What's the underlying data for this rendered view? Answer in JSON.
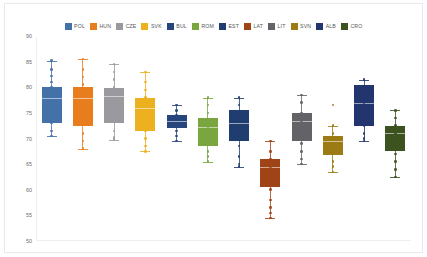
{
  "chart_data": {
    "type": "box",
    "title": "",
    "xlabel": "",
    "ylabel": "",
    "ylim": [
      50,
      90
    ],
    "ytick_labels": [
      "90",
      "85",
      "80",
      "75",
      "70",
      "65",
      "60",
      "55",
      "50"
    ],
    "ytick_values": [
      90,
      85,
      80,
      75,
      70,
      65,
      60,
      55,
      50
    ],
    "grid": false,
    "legend_position": "top-center",
    "categories": [
      "POL",
      "HUN",
      "CZE",
      "SVK",
      "BUL",
      "ROM",
      "EST",
      "LAT",
      "LIT",
      "SVN",
      "ALB",
      "CRO"
    ],
    "colors": [
      "#4472a8",
      "#e87d1e",
      "#9a9a9e",
      "#edb01f",
      "#26457c",
      "#7aa63f",
      "#1f3d6e",
      "#9e4416",
      "#636367",
      "#9c7a14",
      "#23356e",
      "#3c5320"
    ],
    "series": [
      {
        "name": "POL",
        "color": "#4472a8",
        "whisker_high": 85.2,
        "q3": 80.0,
        "median": 78.0,
        "q1": 73.0,
        "whisker_low": 70.5,
        "points": [
          85.2,
          83.5,
          82.2,
          81.0,
          80.0,
          78.6,
          77.5,
          75.0,
          73.0,
          71.5,
          70.5
        ]
      },
      {
        "name": "HUN",
        "color": "#e87d1e",
        "whisker_high": 85.5,
        "q3": 80.0,
        "median": 78.0,
        "q1": 72.5,
        "whisker_low": 68.0,
        "points": [
          85.5,
          83.5,
          82.0,
          80.5,
          78.5,
          77.0,
          75.0,
          73.0,
          71.0,
          69.5,
          68.0
        ]
      },
      {
        "name": "CZE",
        "color": "#9a9a9e",
        "whisker_high": 84.5,
        "q3": 79.8,
        "median": 78.2,
        "q1": 73.0,
        "whisker_low": 69.8,
        "points": [
          84.5,
          83.0,
          81.5,
          80.0,
          78.5,
          77.0,
          75.5,
          73.5,
          71.5,
          70.2,
          69.8
        ]
      },
      {
        "name": "SVK",
        "color": "#edb01f",
        "whisker_high": 83.0,
        "q3": 78.0,
        "median": 76.0,
        "q1": 71.5,
        "whisker_low": 67.5,
        "points": [
          83.0,
          81.0,
          79.5,
          78.0,
          76.5,
          75.0,
          73.5,
          71.5,
          70.0,
          68.5,
          67.5
        ]
      },
      {
        "name": "BUL",
        "color": "#26457c",
        "whisker_high": 76.5,
        "q3": 74.5,
        "median": 73.5,
        "q1": 72.0,
        "whisker_low": 69.5,
        "points": [
          76.5,
          75.5,
          74.5,
          73.8,
          73.0,
          72.5,
          71.5,
          70.5,
          69.5
        ]
      },
      {
        "name": "ROM",
        "color": "#7aa63f",
        "whisker_high": 78.0,
        "q3": 74.0,
        "median": 72.2,
        "q1": 68.5,
        "whisker_low": 65.5,
        "points": [
          78.0,
          76.5,
          75.0,
          73.5,
          72.0,
          70.5,
          69.0,
          67.5,
          66.5,
          65.5
        ]
      },
      {
        "name": "EST",
        "color": "#1f3d6e",
        "whisker_high": 78.0,
        "q3": 75.5,
        "median": 73.0,
        "q1": 69.5,
        "whisker_low": 64.5,
        "points": [
          78.0,
          76.5,
          75.0,
          73.5,
          72.0,
          70.0,
          68.5,
          66.5,
          65.0,
          64.5
        ]
      },
      {
        "name": "LAT",
        "color": "#9e4416",
        "whisker_high": 69.5,
        "q3": 66.0,
        "median": 64.5,
        "q1": 60.5,
        "whisker_low": 54.5,
        "points": [
          69.5,
          67.5,
          66.0,
          64.5,
          63.0,
          61.5,
          60.0,
          58.0,
          56.5,
          55.5,
          54.5
        ]
      },
      {
        "name": "LIT",
        "color": "#636367",
        "whisker_high": 78.5,
        "q3": 75.0,
        "median": 73.5,
        "q1": 69.5,
        "whisker_low": 65.0,
        "points": [
          78.5,
          77.0,
          75.0,
          73.5,
          72.0,
          70.5,
          69.0,
          67.5,
          66.0,
          65.0
        ]
      },
      {
        "name": "SVN",
        "color": "#9c7a14",
        "whisker_high": 72.5,
        "q3": 70.5,
        "median": 69.5,
        "q1": 66.8,
        "whisker_low": 63.5,
        "points": [
          76.5,
          72.5,
          71.0,
          70.0,
          69.0,
          68.0,
          67.0,
          65.5,
          64.5,
          63.5
        ]
      },
      {
        "name": "ALB",
        "color": "#23356e",
        "whisker_high": 81.5,
        "q3": 80.5,
        "median": 77.0,
        "q1": 72.5,
        "whisker_low": 69.5,
        "points": [
          81.5,
          80.0,
          78.5,
          77.0,
          75.5,
          74.0,
          72.5,
          71.0,
          70.0,
          69.5
        ]
      },
      {
        "name": "CRO",
        "color": "#3c5320",
        "whisker_high": 75.5,
        "q3": 72.5,
        "median": 71.0,
        "q1": 67.5,
        "whisker_low": 62.5,
        "points": [
          75.5,
          74.0,
          72.5,
          71.0,
          70.0,
          68.5,
          67.0,
          65.5,
          64.0,
          62.5
        ]
      }
    ]
  }
}
